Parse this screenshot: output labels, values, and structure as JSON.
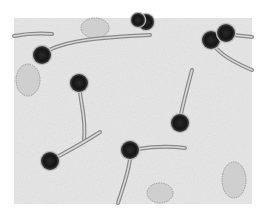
{
  "image": {
    "subject": "electron micrograph of bacteriophages",
    "frame": {
      "x": 14,
      "y": 18,
      "width": 238,
      "height": 186
    },
    "background_color": "#e6e6e6",
    "page_color": "#ffffff",
    "head_color": "#1a1a1a",
    "tail_color": "#8a8a8a",
    "debris_color": "#9a9a9a"
  },
  "phages": [
    {
      "head": {
        "cx": 42,
        "cy": 55,
        "r": 9
      },
      "tail": "M49,50 C70,40 100,38 130,36 L150,35"
    },
    {
      "head": {
        "cx": 79,
        "cy": 83,
        "r": 9
      },
      "tail": "M80,92 C82,110 86,120 84,140"
    },
    {
      "head": {
        "cx": 50,
        "cy": 161,
        "r": 9
      },
      "tail": "M57,157 C70,150 85,142 100,132"
    },
    {
      "head": {
        "cx": 180,
        "cy": 123,
        "r": 9
      },
      "tail": "M181,114 C184,100 188,85 192,70"
    },
    {
      "head": {
        "cx": 130,
        "cy": 150,
        "r": 9
      },
      "tail": "M138,149 C150,147 170,146 185,148"
    },
    {
      "head": {
        "cx": 130,
        "cy": 150,
        "r": 0
      },
      "tail": "M130,159 C128,175 122,190 118,203"
    },
    {
      "head": {
        "cx": 211,
        "cy": 40,
        "r": 9
      },
      "tail": "M216,48 C225,58 240,65 252,70"
    },
    {
      "head": {
        "cx": 226,
        "cy": 33,
        "r": 9
      },
      "tail": "M234,35 C240,36 246,36 252,37"
    },
    {
      "head": {
        "cx": 146,
        "cy": 22,
        "r": 8
      },
      "tail": ""
    },
    {
      "head": {
        "cx": 138,
        "cy": 20,
        "r": 7
      },
      "tail": ""
    },
    {
      "head": {
        "cx": 14,
        "cy": 38,
        "r": 0
      },
      "tail": "M14,36 C25,34 40,33 52,34"
    }
  ],
  "debris": [
    {
      "cx": 95,
      "cy": 28,
      "rx": 14,
      "ry": 10
    },
    {
      "cx": 28,
      "cy": 80,
      "rx": 12,
      "ry": 16
    },
    {
      "cx": 160,
      "cy": 193,
      "rx": 13,
      "ry": 10
    },
    {
      "cx": 234,
      "cy": 180,
      "rx": 12,
      "ry": 18
    }
  ]
}
